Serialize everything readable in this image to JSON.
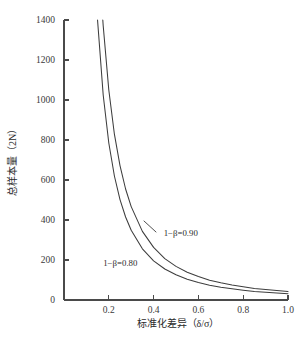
{
  "chart_data": {
    "type": "line",
    "title": "",
    "xlabel": "标准化差异（δ/σ）",
    "ylabel": "总样本量（2N）",
    "xlim": [
      0.0,
      1.0
    ],
    "ylim": [
      0,
      1400
    ],
    "grid": false,
    "legend_position": "inline-annotation",
    "xticks": [
      "0.2",
      "0.4",
      "0.6",
      "0.8",
      "1.0"
    ],
    "xtick_values": [
      0.2,
      0.4,
      0.6,
      0.8,
      1.0
    ],
    "yticks": [
      "0",
      "200",
      "400",
      "600",
      "800",
      "1000",
      "1200",
      "1400"
    ],
    "ytick_values": [
      0,
      200,
      400,
      600,
      800,
      1000,
      1200,
      1400
    ],
    "x": [
      0.13,
      0.15,
      0.175,
      0.2,
      0.225,
      0.25,
      0.275,
      0.3,
      0.35,
      0.4,
      0.45,
      0.5,
      0.55,
      0.6,
      0.65,
      0.7,
      0.75,
      0.8,
      0.85,
      0.9,
      0.95,
      1.0
    ],
    "series": [
      {
        "name": "1−β=0.90",
        "label": "1−β=0.90",
        "power": 0.9,
        "constant": 42.0,
        "values": [
          2485,
          1867,
          1371,
          1050,
          829,
          672,
          555,
          467,
          343,
          263,
          207,
          168,
          139,
          117,
          99,
          86,
          75,
          66,
          58,
          52,
          47,
          42
        ]
      },
      {
        "name": "1−β=0.80",
        "label": "1−β=0.80",
        "power": 0.8,
        "constant": 31.4,
        "values": [
          1858,
          1396,
          1025,
          785,
          620,
          502,
          415,
          349,
          256,
          196,
          155,
          126,
          104,
          87,
          74,
          64,
          56,
          49,
          43,
          39,
          35,
          31
        ]
      }
    ],
    "annotations": [
      {
        "text": "1−β=0.90",
        "x": 0.445,
        "y": 320
      },
      {
        "text": "1−β=0.80",
        "x": 0.175,
        "y": 172
      }
    ],
    "colors": {
      "curve": "#3d3d3d",
      "axis": "#4a4a4a",
      "text": "#2b2b2b",
      "background": "#ffffff"
    }
  }
}
